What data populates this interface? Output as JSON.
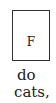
{
  "figure": {
    "box_label": "F"
  },
  "text": {
    "line1": "do",
    "line2": "cats,"
  }
}
